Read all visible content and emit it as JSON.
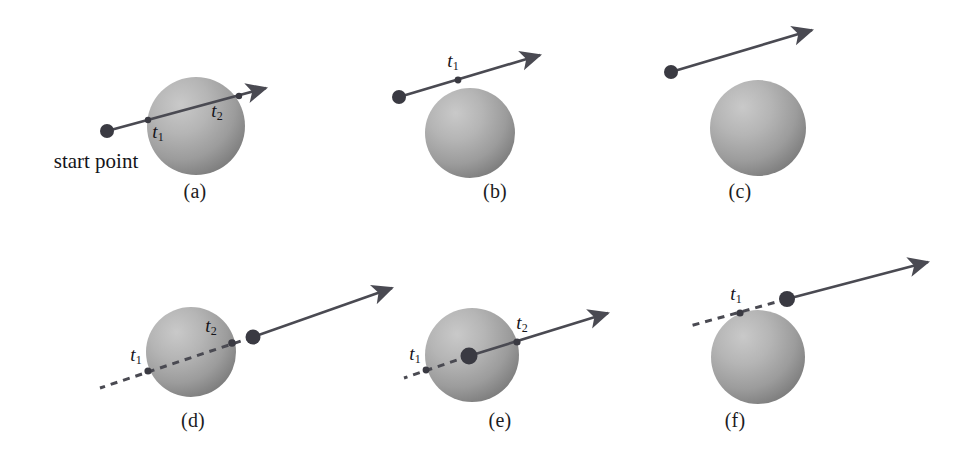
{
  "figure": {
    "background_color": "#ffffff",
    "width": 978,
    "height": 463,
    "line_color": "#4a4a52",
    "sphere_light_color": "#c2c2c2",
    "sphere_mid_color": "#a6a6a6",
    "sphere_dark_color": "#7e7e7e",
    "dot_color": "#3a3a42",
    "text_color": "#15151a"
  },
  "annotations": {
    "start_point_label": "start point",
    "t1_label": "t",
    "t1_sub": "1",
    "t2_label": "t",
    "t2_sub": "2"
  },
  "panels": [
    {
      "id": "a",
      "caption": "(a)",
      "caption_x": 195,
      "caption_y": 192,
      "sphere": {
        "cx": 196,
        "cy": 126,
        "r": 49
      },
      "ray": {
        "start": {
          "x": 107,
          "y": 131
        },
        "tip": {
          "x": 266,
          "y": 88
        },
        "dashed_back": false
      },
      "start_dot": {
        "x": 107,
        "y": 131,
        "r": 7
      },
      "hits": [
        {
          "label": "t1",
          "x": 148,
          "y": 120,
          "r": 3.2,
          "label_x": 158,
          "label_y": 133
        },
        {
          "label": "t2",
          "x": 239,
          "y": 96,
          "r": 3.2,
          "label_x": 217,
          "label_y": 112
        }
      ],
      "start_point_text": {
        "x": 96,
        "y": 161
      }
    },
    {
      "id": "b",
      "caption": "(b)",
      "caption_x": 495,
      "caption_y": 192,
      "sphere": {
        "cx": 470,
        "cy": 133,
        "r": 45
      },
      "ray": {
        "start": {
          "x": 399,
          "y": 97
        },
        "tip": {
          "x": 540,
          "y": 55
        },
        "dashed_back": false
      },
      "start_dot": {
        "x": 399,
        "y": 97,
        "r": 7
      },
      "hits": [
        {
          "label": "t1",
          "x": 458,
          "y": 80,
          "r": 3.4,
          "label_x": 453,
          "label_y": 62
        }
      ],
      "start_point_text": null
    },
    {
      "id": "c",
      "caption": "(c)",
      "caption_x": 740,
      "caption_y": 192,
      "sphere": {
        "cx": 758,
        "cy": 128,
        "r": 48
      },
      "ray": {
        "start": {
          "x": 671,
          "y": 72
        },
        "tip": {
          "x": 812,
          "y": 30
        },
        "dashed_back": false
      },
      "start_dot": {
        "x": 671,
        "y": 72,
        "r": 7
      },
      "hits": [],
      "start_point_text": null
    },
    {
      "id": "d",
      "caption": "(d)",
      "caption_x": 193,
      "caption_y": 421,
      "sphere": {
        "cx": 191,
        "cy": 352,
        "r": 45
      },
      "ray": {
        "start": {
          "x": 253,
          "y": 337
        },
        "tip": {
          "x": 392,
          "y": 288
        },
        "dashed_back": true,
        "back_end": {
          "x": 100,
          "y": 388
        }
      },
      "start_dot": {
        "x": 253,
        "y": 337,
        "r": 7.5
      },
      "hits": [
        {
          "label": "t1",
          "x": 148,
          "y": 371,
          "r": 3.6,
          "label_x": 136,
          "label_y": 356
        },
        {
          "label": "t2",
          "x": 232,
          "y": 343,
          "r": 3.8,
          "label_x": 211,
          "label_y": 327
        }
      ],
      "start_point_text": null
    },
    {
      "id": "e",
      "caption": "(e)",
      "caption_x": 500,
      "caption_y": 421,
      "sphere": {
        "cx": 472,
        "cy": 355,
        "r": 47
      },
      "ray": {
        "start": {
          "x": 469,
          "y": 356
        },
        "tip": {
          "x": 608,
          "y": 313
        },
        "dashed_back": true,
        "back_end": {
          "x": 404,
          "y": 378
        }
      },
      "start_dot": {
        "x": 469,
        "y": 356,
        "r": 8.5
      },
      "hits": [
        {
          "label": "t1",
          "x": 426,
          "y": 370,
          "r": 3.4,
          "label_x": 415,
          "label_y": 355
        },
        {
          "label": "t2",
          "x": 517,
          "y": 342,
          "r": 3.6,
          "label_x": 522,
          "label_y": 324
        }
      ],
      "start_point_text": null
    },
    {
      "id": "f",
      "caption": "(f)",
      "caption_x": 735,
      "caption_y": 421,
      "sphere": {
        "cx": 758,
        "cy": 357,
        "r": 47
      },
      "ray": {
        "start": {
          "x": 787,
          "y": 299
        },
        "tip": {
          "x": 928,
          "y": 262
        },
        "dashed_back": true,
        "back_end": {
          "x": 690,
          "y": 326
        }
      },
      "start_dot": {
        "x": 787,
        "y": 299,
        "r": 8
      },
      "hits": [
        {
          "label": "t1",
          "x": 740,
          "y": 313,
          "r": 3.6,
          "label_x": 736,
          "label_y": 295
        }
      ],
      "start_point_text": null
    }
  ]
}
